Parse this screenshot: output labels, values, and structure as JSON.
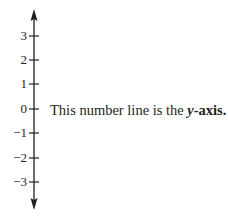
{
  "diagram": {
    "axis_name": "y-axis",
    "ticks": [
      {
        "value": 3,
        "label": "3",
        "y": 36
      },
      {
        "value": 2,
        "label": "2",
        "y": 60
      },
      {
        "value": 1,
        "label": "1",
        "y": 84
      },
      {
        "value": 0,
        "label": "0",
        "y": 109
      },
      {
        "value": -1,
        "label": "−1",
        "y": 133
      },
      {
        "value": -2,
        "label": "−2",
        "y": 158
      },
      {
        "value": -3,
        "label": "−3",
        "y": 182
      }
    ],
    "caption": {
      "text": "This number line is the ",
      "emph_var": "y",
      "emph_rest": "-axis."
    },
    "colors": {
      "line": "#231f20",
      "text": "#231f20",
      "background": "#ffffff"
    }
  }
}
